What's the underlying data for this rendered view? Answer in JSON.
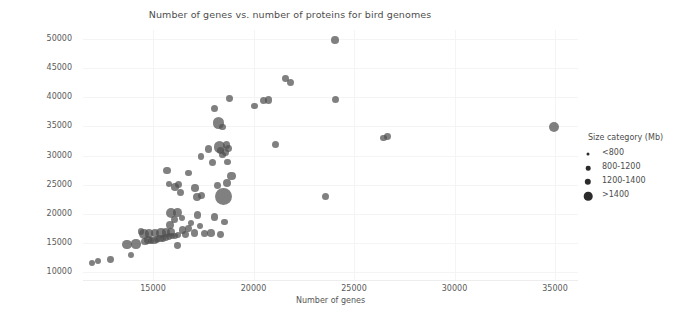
{
  "chart_data": {
    "type": "scatter",
    "title": "Number of genes vs. number of proteins for bird genomes",
    "xlabel": "Number of genes",
    "ylabel": "Number of proteins",
    "xlim": [
      11000,
      36000
    ],
    "ylim": [
      9000,
      51500
    ],
    "xticks": [
      15000,
      20000,
      25000,
      30000,
      35000
    ],
    "yticks": [
      10000,
      15000,
      20000,
      25000,
      30000,
      35000,
      40000,
      45000,
      50000
    ],
    "xtick_labels": [
      "15000",
      "20000",
      "25000",
      "30000",
      "35000"
    ],
    "ytick_labels": [
      "10000",
      "15000",
      "20000",
      "25000",
      "30000",
      "35000",
      "40000",
      "45000",
      "50000"
    ],
    "grid": true,
    "legend": {
      "title": "Size category (Mb)",
      "position": "right",
      "entries": [
        {
          "label": "<800",
          "size_px": 3
        },
        {
          "label": "800-1200",
          "size_px": 4.6
        },
        {
          "label": "1200-1400",
          "size_px": 6.4
        },
        {
          "label": ">1400",
          "size_px": 8.6
        }
      ]
    },
    "marker_color": "#4f4f4f",
    "marker_opacity": 0.72,
    "size_field": "Size category (Mb)",
    "points": [
      {
        "x": 11950,
        "y": 11550,
        "s": 3.0
      },
      {
        "x": 12250,
        "y": 11900,
        "s": 3.2
      },
      {
        "x": 12900,
        "y": 12100,
        "s": 3.4
      },
      {
        "x": 13900,
        "y": 12950,
        "s": 3.2
      },
      {
        "x": 13700,
        "y": 14700,
        "s": 4.8
      },
      {
        "x": 14150,
        "y": 14800,
        "s": 4.6
      },
      {
        "x": 14600,
        "y": 15300,
        "s": 3.6
      },
      {
        "x": 14750,
        "y": 15500,
        "s": 4.0
      },
      {
        "x": 14900,
        "y": 15350,
        "s": 3.4
      },
      {
        "x": 15050,
        "y": 15450,
        "s": 3.6
      },
      {
        "x": 15200,
        "y": 15550,
        "s": 3.4
      },
      {
        "x": 15350,
        "y": 15700,
        "s": 3.6
      },
      {
        "x": 15500,
        "y": 15800,
        "s": 3.4
      },
      {
        "x": 15650,
        "y": 15900,
        "s": 3.2
      },
      {
        "x": 15800,
        "y": 16050,
        "s": 3.4
      },
      {
        "x": 15950,
        "y": 16150,
        "s": 3.2
      },
      {
        "x": 16100,
        "y": 16250,
        "s": 3.0
      },
      {
        "x": 16250,
        "y": 16300,
        "s": 3.0
      },
      {
        "x": 14550,
        "y": 16500,
        "s": 5.0
      },
      {
        "x": 14800,
        "y": 16600,
        "s": 4.4
      },
      {
        "x": 15100,
        "y": 16650,
        "s": 4.2
      },
      {
        "x": 15400,
        "y": 16700,
        "s": 4.8
      },
      {
        "x": 15650,
        "y": 16750,
        "s": 4.2
      },
      {
        "x": 15900,
        "y": 16800,
        "s": 4.0
      },
      {
        "x": 14400,
        "y": 16950,
        "s": 3.4
      },
      {
        "x": 16600,
        "y": 16450,
        "s": 3.4
      },
      {
        "x": 17050,
        "y": 16700,
        "s": 3.6
      },
      {
        "x": 17550,
        "y": 16550,
        "s": 3.6
      },
      {
        "x": 17900,
        "y": 16650,
        "s": 3.8
      },
      {
        "x": 18350,
        "y": 16400,
        "s": 3.4
      },
      {
        "x": 16200,
        "y": 14500,
        "s": 3.4
      },
      {
        "x": 16450,
        "y": 17200,
        "s": 3.6
      },
      {
        "x": 16750,
        "y": 17500,
        "s": 3.4
      },
      {
        "x": 15850,
        "y": 18000,
        "s": 4.0
      },
      {
        "x": 16900,
        "y": 18450,
        "s": 3.2
      },
      {
        "x": 17350,
        "y": 17900,
        "s": 3.2
      },
      {
        "x": 16050,
        "y": 19000,
        "s": 3.6
      },
      {
        "x": 16450,
        "y": 19300,
        "s": 3.2
      },
      {
        "x": 15900,
        "y": 20100,
        "s": 5.0
      },
      {
        "x": 16200,
        "y": 20200,
        "s": 4.4
      },
      {
        "x": 17200,
        "y": 19800,
        "s": 3.6
      },
      {
        "x": 18050,
        "y": 19400,
        "s": 3.8
      },
      {
        "x": 18550,
        "y": 18600,
        "s": 3.4
      },
      {
        "x": 18500,
        "y": 22900,
        "s": 8.4
      },
      {
        "x": 17200,
        "y": 22850,
        "s": 4.0
      },
      {
        "x": 17400,
        "y": 23200,
        "s": 3.6
      },
      {
        "x": 16350,
        "y": 23600,
        "s": 3.6
      },
      {
        "x": 16100,
        "y": 24600,
        "s": 3.8
      },
      {
        "x": 16250,
        "y": 25000,
        "s": 3.6
      },
      {
        "x": 15800,
        "y": 25100,
        "s": 3.4
      },
      {
        "x": 17100,
        "y": 24400,
        "s": 3.8
      },
      {
        "x": 18200,
        "y": 24900,
        "s": 3.4
      },
      {
        "x": 18700,
        "y": 25200,
        "s": 4.0
      },
      {
        "x": 18900,
        "y": 26500,
        "s": 4.2
      },
      {
        "x": 15700,
        "y": 27400,
        "s": 3.6
      },
      {
        "x": 16750,
        "y": 27000,
        "s": 3.4
      },
      {
        "x": 17950,
        "y": 28800,
        "s": 3.6
      },
      {
        "x": 18700,
        "y": 28900,
        "s": 3.4
      },
      {
        "x": 18450,
        "y": 30100,
        "s": 3.4
      },
      {
        "x": 18600,
        "y": 30500,
        "s": 3.6
      },
      {
        "x": 18350,
        "y": 30900,
        "s": 3.6
      },
      {
        "x": 18750,
        "y": 31200,
        "s": 3.4
      },
      {
        "x": 18300,
        "y": 31450,
        "s": 5.6
      },
      {
        "x": 18650,
        "y": 31800,
        "s": 3.6
      },
      {
        "x": 17750,
        "y": 31100,
        "s": 3.6
      },
      {
        "x": 17400,
        "y": 29800,
        "s": 3.2
      },
      {
        "x": 21100,
        "y": 31900,
        "s": 3.6
      },
      {
        "x": 23600,
        "y": 23000,
        "s": 3.6
      },
      {
        "x": 26450,
        "y": 33000,
        "s": 3.4
      },
      {
        "x": 26650,
        "y": 33300,
        "s": 3.4
      },
      {
        "x": 34950,
        "y": 34950,
        "s": 5.0
      },
      {
        "x": 18450,
        "y": 34900,
        "s": 3.4
      },
      {
        "x": 18250,
        "y": 35600,
        "s": 5.8
      },
      {
        "x": 18050,
        "y": 38000,
        "s": 3.6
      },
      {
        "x": 18800,
        "y": 39750,
        "s": 3.4
      },
      {
        "x": 20050,
        "y": 38500,
        "s": 3.4
      },
      {
        "x": 20500,
        "y": 39400,
        "s": 3.6
      },
      {
        "x": 20750,
        "y": 39500,
        "s": 3.8
      },
      {
        "x": 24100,
        "y": 39600,
        "s": 3.6
      },
      {
        "x": 21600,
        "y": 43200,
        "s": 3.4
      },
      {
        "x": 21850,
        "y": 42600,
        "s": 3.6
      },
      {
        "x": 24050,
        "y": 49800,
        "s": 3.8
      }
    ]
  }
}
